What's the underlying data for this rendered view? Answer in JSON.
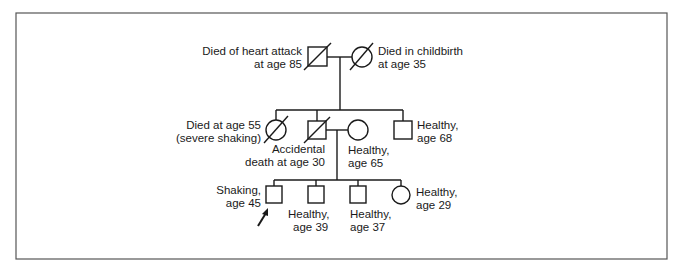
{
  "diagram": {
    "type": "pedigree",
    "generations": [
      {
        "label": "I",
        "individuals": [
          {
            "id": "I-1",
            "sex": "male",
            "deceased": true,
            "affected": false,
            "label_lines": [
              "Died of heart attack",
              "at age 85"
            ]
          },
          {
            "id": "I-2",
            "sex": "female",
            "deceased": true,
            "affected": false,
            "label_lines": [
              "Died in childbirth",
              "at age 35"
            ]
          }
        ]
      },
      {
        "label": "II",
        "individuals": [
          {
            "id": "II-1",
            "sex": "female",
            "deceased": true,
            "affected": false,
            "label_lines": [
              "Died at age 55",
              "(severe shaking)"
            ]
          },
          {
            "id": "II-2",
            "sex": "male",
            "deceased": true,
            "affected": false,
            "label_lines": [
              "Accidental",
              "death at age 30"
            ]
          },
          {
            "id": "II-3",
            "sex": "female",
            "deceased": false,
            "affected": false,
            "married_in": true,
            "label_lines": [
              "Healthy,",
              "age 65"
            ]
          },
          {
            "id": "II-4",
            "sex": "male",
            "deceased": false,
            "affected": false,
            "label_lines": [
              "Healthy,",
              "age 68"
            ]
          }
        ]
      },
      {
        "label": "III",
        "individuals": [
          {
            "id": "III-1",
            "sex": "male",
            "deceased": false,
            "affected": false,
            "proband": true,
            "label_lines": [
              "Shaking,",
              "age 45"
            ]
          },
          {
            "id": "III-2",
            "sex": "male",
            "deceased": false,
            "affected": false,
            "label_lines": [
              "Healthy,",
              "age 39"
            ]
          },
          {
            "id": "III-3",
            "sex": "male",
            "deceased": false,
            "affected": false,
            "label_lines": [
              "Healthy,",
              "age 37"
            ]
          },
          {
            "id": "III-4",
            "sex": "female",
            "deceased": false,
            "affected": false,
            "label_lines": [
              "Healthy,",
              "age 29"
            ]
          }
        ]
      }
    ],
    "proband_marker": "arrow",
    "colors": {
      "stroke": "#1a1a1a",
      "frame": "#555555",
      "background": "#ffffff"
    }
  }
}
